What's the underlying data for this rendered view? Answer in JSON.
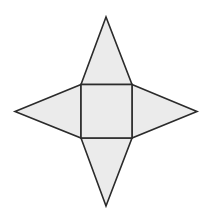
{
  "diagram": {
    "type": "net",
    "colors": {
      "fill": "#ebebeb",
      "stroke": "#2b2b2b",
      "background": "#ffffff"
    },
    "square_base": {
      "x1": 81,
      "y1": 84.5,
      "x2": 132,
      "y2": 138
    },
    "triangles": [
      {
        "name": "top",
        "apex": [
          106,
          17
        ]
      },
      {
        "name": "left",
        "apex": [
          15,
          111.5
        ]
      },
      {
        "name": "right",
        "apex": [
          197,
          111.5
        ]
      },
      {
        "name": "bottom",
        "apex": [
          106,
          206
        ]
      }
    ]
  }
}
